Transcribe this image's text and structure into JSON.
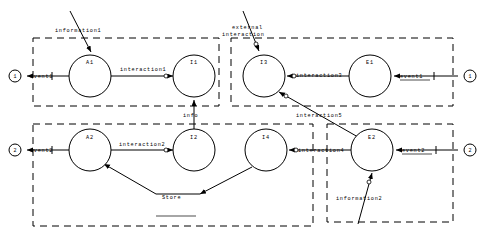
{
  "diagram": {
    "background_color": "#ffffff",
    "stroke_color": "#000000",
    "nodes": [
      {
        "id": "A1",
        "label": "A1",
        "cx": 90,
        "cy": 76,
        "r": 21
      },
      {
        "id": "I1",
        "label": "I1",
        "cx": 194,
        "cy": 76,
        "r": 21
      },
      {
        "id": "I3",
        "label": "I3",
        "cx": 264,
        "cy": 76,
        "r": 21
      },
      {
        "id": "E1",
        "label": "E1",
        "cx": 370,
        "cy": 76,
        "r": 21
      },
      {
        "id": "A2",
        "label": "A2",
        "cx": 90,
        "cy": 150,
        "r": 21
      },
      {
        "id": "I2",
        "label": "I2",
        "cx": 194,
        "cy": 150,
        "r": 21
      },
      {
        "id": "I4",
        "label": "I4",
        "cx": 266,
        "cy": 150,
        "r": 21
      },
      {
        "id": "E2",
        "label": "E2",
        "cx": 372,
        "cy": 150,
        "r": 21
      }
    ],
    "ports": [
      {
        "id": "port-left-1",
        "label": "1",
        "cx": 15,
        "cy": 76,
        "r": 6
      },
      {
        "id": "port-right-1",
        "label": "1",
        "cx": 470,
        "cy": 76,
        "r": 6
      },
      {
        "id": "port-left-2",
        "label": "2",
        "cx": 15,
        "cy": 150,
        "r": 6
      },
      {
        "id": "port-right-2",
        "label": "2",
        "cx": 470,
        "cy": 150,
        "r": 6
      }
    ],
    "groups": [
      {
        "id": "group-top-left",
        "x": 33,
        "y": 38,
        "width": 186,
        "height": 68
      },
      {
        "id": "group-top-right",
        "x": 231,
        "y": 38,
        "width": 222,
        "height": 68
      },
      {
        "id": "group-bottom-left",
        "x": 33,
        "y": 124,
        "width": 280,
        "height": 102
      },
      {
        "id": "group-bottom-right",
        "x": 327,
        "y": 124,
        "width": 126,
        "height": 98
      }
    ],
    "edge_labels": [
      {
        "id": "label-event1-left",
        "text": "event1",
        "x": 30,
        "y": 78
      },
      {
        "id": "label-interaction1",
        "text": "interaction1",
        "x": 120,
        "y": 71
      },
      {
        "id": "label-external",
        "text": "external",
        "x": 232,
        "y": 29
      },
      {
        "id": "label-interaction",
        "text": "interaction",
        "x": 222,
        "y": 36
      },
      {
        "id": "label-interaction3",
        "text": "interaction3",
        "x": 296,
        "y": 77
      },
      {
        "id": "label-event1-right",
        "text": "event1",
        "x": 413,
        "y": 78
      },
      {
        "id": "label-info",
        "text": "info",
        "x": 183,
        "y": 117
      },
      {
        "id": "label-information1",
        "text": "information1",
        "x": 55,
        "y": 32
      },
      {
        "id": "label-interaction5",
        "text": "interaction5",
        "x": 296,
        "y": 117
      },
      {
        "id": "label-event2-left",
        "text": "event2",
        "x": 30,
        "y": 152
      },
      {
        "id": "label-interaction2",
        "text": "interaction2",
        "x": 119,
        "y": 146
      },
      {
        "id": "label-interaction4",
        "text": "interaction4",
        "x": 298,
        "y": 152
      },
      {
        "id": "label-event2-right",
        "text": "event2",
        "x": 414,
        "y": 152
      },
      {
        "id": "label-store",
        "text": "Store",
        "x": 162,
        "y": 199
      },
      {
        "id": "label-information2",
        "text": "information2",
        "x": 336,
        "y": 200
      }
    ]
  }
}
